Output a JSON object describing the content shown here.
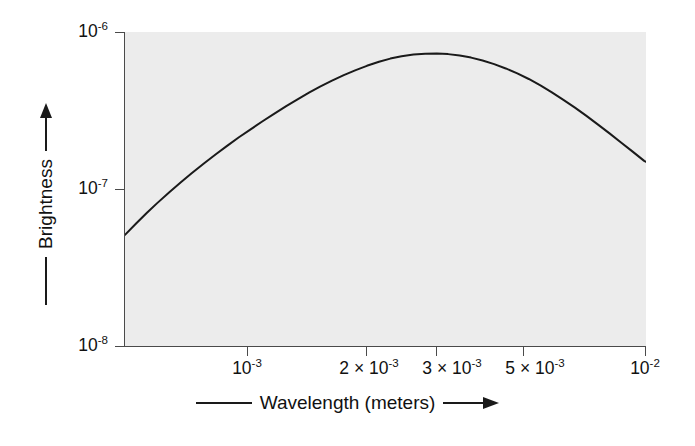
{
  "figure": {
    "background_color": "#ffffff",
    "plot_background_color": "#ececec",
    "axis_color": "#4a4a4a",
    "curve_color": "#1a1a1a"
  },
  "axes": {
    "x_title_text": "Wavelength (meters)",
    "y_title_text": "Brightness",
    "x_tick_labels": [
      {
        "mantissa": "",
        "base": "10",
        "exponent": "-3",
        "value": 0.001
      },
      {
        "mantissa": "2 × ",
        "base": "10",
        "exponent": "-3",
        "value": 0.002
      },
      {
        "mantissa": "3 × ",
        "base": "10",
        "exponent": "-3",
        "value": 0.003
      },
      {
        "mantissa": "5 × ",
        "base": "10",
        "exponent": "-3",
        "value": 0.005
      },
      {
        "mantissa": "",
        "base": "10",
        "exponent": "-2",
        "value": 0.01
      }
    ],
    "y_tick_labels": [
      {
        "base": "10",
        "exponent": "-6",
        "value": 1e-06
      },
      {
        "base": "10",
        "exponent": "-7",
        "value": 1e-07
      },
      {
        "base": "10",
        "exponent": "-8",
        "value": 1e-08
      }
    ]
  },
  "chart_data": {
    "type": "line",
    "title": "",
    "subtitle": "",
    "xlabel": "Wavelength (meters)",
    "ylabel": "Brightness",
    "xscale": "log",
    "yscale": "log",
    "xlim": [
      0.00042,
      0.01
    ],
    "ylim": [
      1e-08,
      1e-06
    ],
    "grid": false,
    "legend": null,
    "annotations": [],
    "series": [
      {
        "name": "Blackbody spectrum",
        "x": [
          0.00042,
          0.00045,
          0.00048,
          0.00051,
          0.00055,
          0.00059,
          0.00063,
          0.00068,
          0.00073,
          0.00078,
          0.00084,
          0.0009,
          0.00097,
          0.00104,
          0.00112,
          0.0012,
          0.00129,
          0.00138,
          0.00148,
          0.00159,
          0.00171,
          0.00183,
          0.00197,
          0.00211,
          0.00226,
          0.00243,
          0.00261,
          0.0028,
          0.003,
          0.00322,
          0.00345,
          0.0037,
          0.00397,
          0.00426,
          0.00457,
          0.0049,
          0.00526,
          0.00564,
          0.00605,
          0.00649,
          0.00696,
          0.00747,
          0.00801,
          0.00859,
          0.00922,
          0.00989,
          0.01
        ],
        "y": [
          5.1e-08,
          6.05e-08,
          7.05e-08,
          8.1e-08,
          9.55e-08,
          1.105e-07,
          1.26e-07,
          1.46e-07,
          1.665e-07,
          1.875e-07,
          2.135e-07,
          2.39e-07,
          2.7e-07,
          3.01e-07,
          3.37e-07,
          3.72e-07,
          4.12e-07,
          4.5e-07,
          4.9e-07,
          5.31e-07,
          5.72e-07,
          6.09e-07,
          6.46e-07,
          6.77e-07,
          7e-07,
          7.18e-07,
          7.27e-07,
          7.29e-07,
          7.23e-07,
          7.08e-07,
          6.87e-07,
          6.59e-07,
          6.24e-07,
          5.86e-07,
          5.45e-07,
          5.02e-07,
          4.57e-07,
          4.13e-07,
          3.7e-07,
          3.3e-07,
          2.92e-07,
          2.57e-07,
          2.26e-07,
          1.98e-07,
          1.73e-07,
          1.51e-07,
          1.49e-07
        ]
      }
    ]
  }
}
